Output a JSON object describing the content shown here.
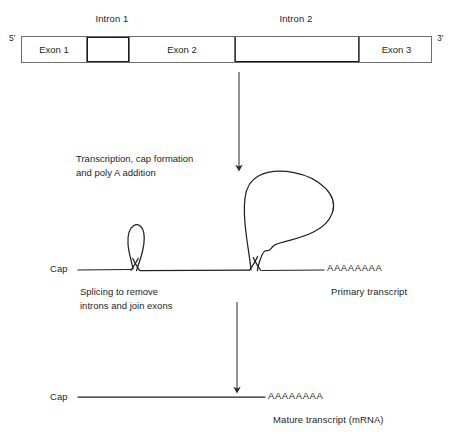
{
  "diagram": {
    "background_color": "#ffffff",
    "line_color": "#221f1f",
    "box_border_color": "#6e6e6e",
    "intron_border_color": "#141414"
  },
  "gene": {
    "five_prime_label": "5'",
    "three_prime_label": "3'",
    "intron_label_1": "Intron 1",
    "intron_label_2": "Intron 2",
    "segments": [
      {
        "id": "exon1",
        "label": "Exon 1",
        "kind": "exon"
      },
      {
        "id": "intron1",
        "label": "",
        "kind": "intron"
      },
      {
        "id": "exon2",
        "label": "Exon 2",
        "kind": "exon"
      },
      {
        "id": "intron2",
        "label": "",
        "kind": "intron"
      },
      {
        "id": "exon3",
        "label": "Exon 3",
        "kind": "exon"
      }
    ]
  },
  "steps": {
    "transcription": "Transcription, cap formation\nand poly A addition",
    "splicing": "Splicing to remove\nintrons and join exons"
  },
  "primary_transcript": {
    "cap_label": "Cap",
    "poly_a_label": "AAAAAAAA",
    "name_label": "Primary transcript"
  },
  "mature_transcript": {
    "cap_label": "Cap",
    "poly_a_label": "AAAAAAAA",
    "name_label": "Mature transcript (mRNA)"
  },
  "arrows": {
    "arrow1_name": "transcription-arrow",
    "arrow2_name": "splicing-arrow"
  }
}
